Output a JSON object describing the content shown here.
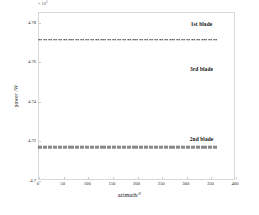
{
  "chart_data": {
    "type": "line",
    "title": "",
    "xlabel": "azimuth/°",
    "ylabel": "power /W",
    "y_multiplier": "× 10",
    "y_multiplier_exponent": "5",
    "xlim": [
      0,
      400
    ],
    "ylim": [
      4.7,
      4.785
    ],
    "grid": false,
    "legend_position": "inline-annotation",
    "xticks": [
      "0",
      "50",
      "100",
      "150",
      "200",
      "250",
      "300",
      "350",
      "400"
    ],
    "xtick_values": [
      0,
      50,
      100,
      150,
      200,
      250,
      300,
      350,
      400
    ],
    "yticks": [
      "4.7",
      "4.72",
      "4.74",
      "4.76",
      "4.78"
    ],
    "ytick_values": [
      4.7,
      4.72,
      4.74,
      4.76,
      4.78
    ],
    "series": [
      {
        "name": "1st blade",
        "label": "1st blade",
        "style": "dotted",
        "weight": "thin",
        "value": 4.7715,
        "x_start": 0,
        "x_end": 360,
        "label_x": 330,
        "label_y": 4.7795,
        "n_points": 73
      },
      {
        "name": "3rd blade",
        "label": "3rd blade",
        "style": "dotted",
        "weight": "thin",
        "value": 4.7715,
        "x_start": 0,
        "x_end": 360,
        "label_x": 330,
        "label_y": 4.7565,
        "n_points": 73,
        "overlapped": true
      },
      {
        "name": "2nd blade",
        "label": "2nd blade",
        "style": "dotted",
        "weight": "thick",
        "value": 4.7172,
        "x_start": 0,
        "x_end": 360,
        "label_x": 330,
        "label_y": 4.7215,
        "n_points": 73
      }
    ]
  },
  "figure": {
    "background_color": "#ffffff",
    "frame_color": "#d8d8d8",
    "text_color": "#1a1a1a",
    "marker_color": "#1c1c1c"
  }
}
